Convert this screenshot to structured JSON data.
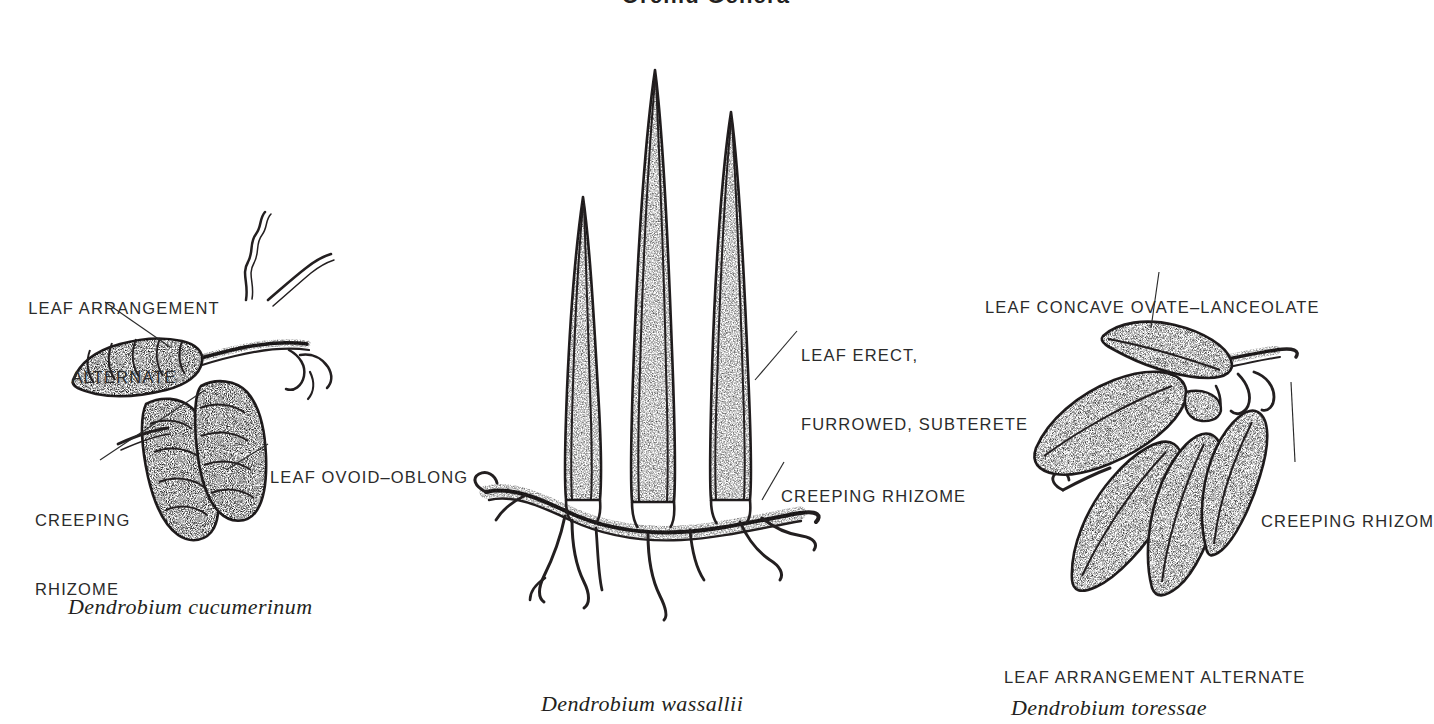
{
  "page": {
    "title": "Orchid Genera",
    "background_color": "#ffffff",
    "ink_color": "#231f20",
    "text_color": "#2b2b2b"
  },
  "specimens": [
    {
      "id": "dendrobium-cucumerinum",
      "caption": "Dendrobium cucumerinum",
      "labels": [
        {
          "id": "leaf-arrangement-alternate",
          "line1": "LEAF ARRANGEMENT",
          "line2": "ALTERNATE"
        },
        {
          "id": "creeping-rhizome",
          "line1": "CREEPING",
          "line2": "RHIZOME"
        },
        {
          "id": "leaf-ovoid-oblong",
          "line1": "LEAF OVOID–OBLONG",
          "line2": ""
        }
      ]
    },
    {
      "id": "dendrobium-wassallii",
      "caption": "Dendrobium wassallii",
      "labels": [
        {
          "id": "leaf-erect-furrowed-subterete",
          "line1": "LEAF ERECT,",
          "line2": "FURROWED, SUBTERETE"
        },
        {
          "id": "creeping-rhizome",
          "line1": "CREEPING RHIZOME",
          "line2": ""
        }
      ]
    },
    {
      "id": "dendrobium-toressae",
      "caption": "Dendrobium toressae",
      "labels": [
        {
          "id": "leaf-concave-ovate-lanceolate",
          "line1": "LEAF CONCAVE OVATE–LANCEOLATE",
          "line2": ""
        },
        {
          "id": "creeping-rhizome",
          "line1": "CREEPING RHIZOM",
          "line2": ""
        },
        {
          "id": "leaf-arrangement-alternate",
          "line1": "LEAF ARRANGEMENT ALTERNATE",
          "line2": ""
        }
      ]
    }
  ]
}
